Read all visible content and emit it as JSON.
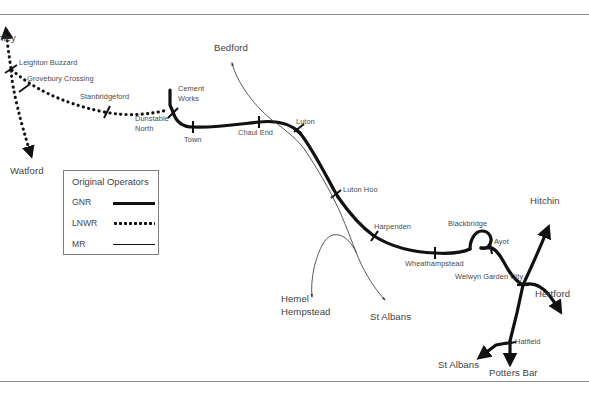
{
  "figure": {
    "kind": "railway-route-diagram",
    "background_color": "#ffffff",
    "rule_color": "#8d8d8d",
    "line_color": "#111111",
    "text_color": "#4a4a4a"
  },
  "legend": {
    "title": "Original Operators",
    "entries": [
      {
        "key": "GNR",
        "style": "thick-solid",
        "color": "#111111"
      },
      {
        "key": "LNWR",
        "style": "dotted",
        "color": "#111111"
      },
      {
        "key": "MR",
        "style": "thin-solid",
        "color": "#111111"
      }
    ]
  },
  "labels": {
    "bletchley": "hley",
    "leighton_buzzard": "Leighton Buzzard",
    "grovebury_crossing": "Grovebury Crossing",
    "stanbridgeford": "Stanbridgeford",
    "watford": "Watford",
    "dunstable_north_line1": "Dunstable",
    "dunstable_north_line2": "North",
    "cement_works_line1": "Cement",
    "cement_works_line2": "Works",
    "town": "Town",
    "chaul_end": "Chaul End",
    "bedford": "Bedford",
    "luton": "Luton",
    "luton_hoo": "Luton Hoo",
    "harpenden": "Harpenden",
    "hemel_hempstead_line1": "Hemel",
    "hemel_hempstead_line2": "Hempstead",
    "st_albans_mr": "St Albans",
    "wheathampstead": "Wheathampstead",
    "blackbridge": "Blackbridge",
    "ayot": "Ayot",
    "welwyn_garden_city": "Welwyn Garden City",
    "hitchin": "Hitchin",
    "hertford": "Hertford",
    "hatfield": "Hatfield",
    "st_albans_gnr": "St Albans",
    "potters_bar": "Potters Bar"
  },
  "stations": [
    {
      "name": "Leighton Buzzard",
      "operator": "LNWR",
      "x": 11,
      "y": 69
    },
    {
      "name": "Grovebury Crossing",
      "operator": "LNWR",
      "x": 24,
      "y": 88
    },
    {
      "name": "Stanbridgeford",
      "operator": "LNWR",
      "x": 107,
      "y": 112
    },
    {
      "name": "Dunstable North",
      "operator": "LNWR",
      "x": 167,
      "y": 110
    },
    {
      "name": "Town",
      "operator": "GNR",
      "x": 193,
      "y": 127
    },
    {
      "name": "Chaul End",
      "operator": "GNR",
      "x": 259,
      "y": 123
    },
    {
      "name": "Luton",
      "operator": "GNR",
      "x": 298,
      "y": 131
    },
    {
      "name": "Luton Hoo",
      "operator": "GNR",
      "x": 337,
      "y": 194
    },
    {
      "name": "Harpenden",
      "operator": "GNR",
      "x": 375,
      "y": 236
    },
    {
      "name": "Wheathampstead",
      "operator": "GNR",
      "x": 435,
      "y": 252
    },
    {
      "name": "Ayot",
      "operator": "GNR",
      "x": 492,
      "y": 248
    },
    {
      "name": "Welwyn Garden City",
      "operator": "GNR",
      "x": 522,
      "y": 285
    },
    {
      "name": "Hatfield",
      "operator": "GNR",
      "x": 508,
      "y": 344
    }
  ],
  "terminals": [
    {
      "name": "hley",
      "direction": "north-west"
    },
    {
      "name": "Watford",
      "direction": "south"
    },
    {
      "name": "Bedford",
      "direction": "north"
    },
    {
      "name": "Hemel Hempstead",
      "direction": "south-west"
    },
    {
      "name": "St Albans",
      "direction": "south"
    },
    {
      "name": "Hitchin",
      "direction": "north-east"
    },
    {
      "name": "Hertford",
      "direction": "east"
    },
    {
      "name": "St Albans",
      "direction": "south-west"
    },
    {
      "name": "Potters Bar",
      "direction": "south"
    }
  ]
}
